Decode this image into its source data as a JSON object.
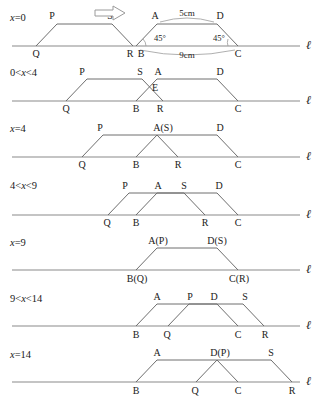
{
  "figure": {
    "line_label": "ℓ",
    "arrow_icon": "right-arrow-icon",
    "dimensions": {
      "top_side": "5cm",
      "base_side": "9cm",
      "angle_left": "45°",
      "angle_right": "45°"
    },
    "stages": [
      {
        "id": "stage-0",
        "case_label": "x=0",
        "case_parts": [
          "x",
          "=0"
        ],
        "points_top": [
          "P",
          "S",
          "A",
          "D"
        ],
        "points_base": [
          "Q",
          "R",
          "B",
          "C"
        ],
        "annotations": [
          "5cm",
          "9cm",
          "45°",
          "45°"
        ]
      },
      {
        "id": "stage-1",
        "case_label": "0<x<4",
        "case_parts": [
          "0<",
          "x",
          "<4"
        ],
        "points_top": [
          "P",
          "S",
          "A",
          "D"
        ],
        "points_base": [
          "Q",
          "B",
          "R",
          "C"
        ],
        "points_extra": [
          "E"
        ],
        "annotations": []
      },
      {
        "id": "stage-2",
        "case_label": "x=4",
        "case_parts": [
          "x",
          "=4"
        ],
        "points_top": [
          "P",
          "A(S)",
          "D"
        ],
        "points_base": [
          "Q",
          "B",
          "R",
          "C"
        ],
        "annotations": []
      },
      {
        "id": "stage-3",
        "case_label": "4<x<9",
        "case_parts": [
          "4<",
          "x",
          "<9"
        ],
        "points_top": [
          "P",
          "A",
          "S",
          "D"
        ],
        "points_base": [
          "Q",
          "B",
          "R",
          "C"
        ],
        "annotations": []
      },
      {
        "id": "stage-4",
        "case_label": "x=9",
        "case_parts": [
          "x",
          "=9"
        ],
        "points_top": [
          "A(P)",
          "D(S)"
        ],
        "points_base": [
          "B(Q)",
          "C(R)"
        ],
        "annotations": []
      },
      {
        "id": "stage-5",
        "case_label": "9<x<14",
        "case_parts": [
          "9<",
          "x",
          "<14"
        ],
        "points_top": [
          "A",
          "P",
          "D",
          "S"
        ],
        "points_base": [
          "B",
          "Q",
          "C",
          "R"
        ],
        "annotations": []
      },
      {
        "id": "stage-6",
        "case_label": "x=14",
        "case_parts": [
          "x",
          "=14"
        ],
        "points_top": [
          "A",
          "D(P)",
          "S"
        ],
        "points_base": [
          "B",
          "Q",
          "C",
          "R"
        ],
        "annotations": []
      }
    ],
    "colors": {
      "axis": "#8a8a8a",
      "figure_stroke": "#6e6e6e",
      "text": "#1a1a1a",
      "background": "#ffffff"
    }
  }
}
